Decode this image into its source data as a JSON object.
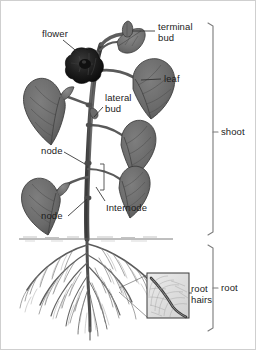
{
  "figure": {
    "background_color": "#ffffff",
    "border_color": "#cfcfcf",
    "width": 256,
    "height": 350
  },
  "labels": {
    "flower": "flower",
    "terminal_bud_line1": "terminal",
    "terminal_bud_line2": "bud",
    "leaf": "leaf",
    "lateral_bud_line1": "lateral",
    "lateral_bud_line2": "bud",
    "node_upper": "node",
    "node_lower": "node",
    "internode": "Internode",
    "root_hairs_line1": "root",
    "root_hairs_line2": "hairs",
    "shoot": "shoot",
    "root": "root"
  },
  "colors": {
    "text": "#1b1b1b",
    "leader_line": "#3a3a3a",
    "bracket": "#808080",
    "leaf_fill": "#6e6e6e",
    "leaf_fill_dark": "#5a5a5a",
    "leaf_edge": "#3c3c3c",
    "vein": "#4a4a4a",
    "stem": "#5c5c5c",
    "stem_edge": "#333333",
    "flower": "#141414",
    "root": "#555555",
    "root_fine": "#8d8d8d",
    "soil_line": "#777777",
    "inset_border": "#3a3a3a",
    "inset_fill": "#e3e3e3"
  },
  "brackets": [
    {
      "name": "shoot",
      "label": "shoot",
      "y_top": 22,
      "y_bottom": 234,
      "tick_y": 131,
      "x": 212
    },
    {
      "name": "root",
      "label": "root",
      "y_top": 244,
      "y_bottom": 330,
      "tick_y": 287,
      "x": 212
    }
  ],
  "callouts": [
    {
      "name": "flower",
      "label": "flower",
      "label_x": 41,
      "label_y": 33,
      "target_x": 80,
      "target_y": 53
    },
    {
      "name": "terminal-bud",
      "label": "terminal bud",
      "label_x": 157,
      "label_y": 26,
      "target_x": 128,
      "target_y": 38
    },
    {
      "name": "leaf",
      "label": "leaf",
      "label_x": 163,
      "label_y": 75,
      "target_x": 140,
      "target_y": 79
    },
    {
      "name": "lateral-bud",
      "label": "lateral bud",
      "label_x": 104,
      "label_y": 96,
      "target_x": 92,
      "target_y": 117
    },
    {
      "name": "node-upper",
      "label": "node",
      "label_x": 40,
      "label_y": 147,
      "target_x": 85,
      "target_y": 162
    },
    {
      "name": "node-lower",
      "label": "node",
      "label_x": 47,
      "label_y": 216,
      "target_x": 86,
      "target_y": 197
    },
    {
      "name": "internode",
      "label": "Internode",
      "label_x": 105,
      "label_y": 203,
      "target_x": 97,
      "target_y": 186
    },
    {
      "name": "root-hairs",
      "label": "root hairs",
      "label_x": 190,
      "label_y": 288,
      "target_x": 186,
      "target_y": 295
    }
  ],
  "inset": {
    "name": "root-hair-detail",
    "x": 146,
    "y": 272,
    "width": 42,
    "height": 45,
    "source_x": 118,
    "source_y": 288
  },
  "soil": {
    "name": "soil-line",
    "y": 238,
    "x_start": 18,
    "x_end": 172
  },
  "plant": {
    "stem_base_x": 86,
    "stem_top_y": 36,
    "root_tip_y": 330
  }
}
